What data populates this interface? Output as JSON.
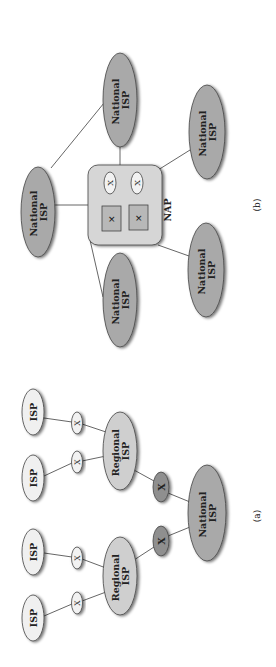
{
  "colors": {
    "national": "#a9a9a9",
    "regional": "#cfcfcf",
    "isp": "#f0f0f0",
    "switch_light": "#f2f2f2",
    "switch_dark": "#8f8f8f",
    "nap_box": "#d6d6d6",
    "nap_router": "#b8b8b8",
    "stroke": "#444444"
  },
  "panel_b": {
    "caption": "(b)",
    "nap_label": "NAP",
    "nap_switch_symbol": "X",
    "nap_router_symbol": "✕",
    "nodes": [
      {
        "id": "n1",
        "line1": "National",
        "line2": "ISP"
      },
      {
        "id": "n2",
        "line1": "National",
        "line2": "ISP"
      },
      {
        "id": "n3",
        "line1": "National",
        "line2": "ISP"
      },
      {
        "id": "n4",
        "line1": "National",
        "line2": "ISP"
      },
      {
        "id": "n5",
        "line1": "National",
        "line2": "ISP"
      }
    ]
  },
  "panel_a": {
    "caption": "(a)",
    "switch_symbol": "X",
    "isps": [
      {
        "label": "ISP"
      },
      {
        "label": "ISP"
      },
      {
        "label": "ISP"
      },
      {
        "label": "ISP"
      }
    ],
    "regional": [
      {
        "line1": "Regional",
        "line2": "ISP"
      },
      {
        "line1": "Regional",
        "line2": "ISP"
      }
    ],
    "national": {
      "line1": "National",
      "line2": "ISP"
    }
  }
}
